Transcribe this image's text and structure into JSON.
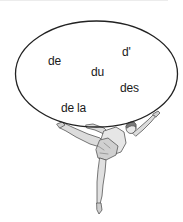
{
  "illustration": {
    "description": "Ballerina balancing a large oval containing French partitive articles",
    "bubble": {
      "shape": "ellipse",
      "stroke_color": "#222222",
      "fill_color": "#ffffff",
      "words": [
        {
          "id": "de",
          "text": "de",
          "x": 48,
          "y": 55
        },
        {
          "id": "du",
          "text": "du",
          "x": 91,
          "y": 66
        },
        {
          "id": "d-apostrophe",
          "text": "d'",
          "x": 122,
          "y": 46
        },
        {
          "id": "des",
          "text": "des",
          "x": 120,
          "y": 82
        },
        {
          "id": "de-la",
          "text": "de la",
          "x": 61,
          "y": 102
        }
      ]
    },
    "figure": {
      "type": "ballerina",
      "pose": "arabesque on pointe, arms raised supporting the oval",
      "colors": {
        "outline": "#555555",
        "fill": "#d8d8d8",
        "hair": "#7a7a7a"
      }
    }
  }
}
